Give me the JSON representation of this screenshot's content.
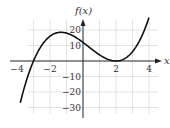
{
  "chart_data": {
    "type": "line",
    "title": "",
    "xlabel": "x",
    "ylabel": "f(x)",
    "xlim": [
      -4,
      4
    ],
    "ylim": [
      -35,
      28
    ],
    "grid": true,
    "x_ticks": [
      -4,
      -2,
      2,
      4
    ],
    "x_tick_labels": [
      "−4",
      "−2",
      "2",
      "4"
    ],
    "y_ticks": [
      20,
      10,
      -10,
      -20,
      -30
    ],
    "y_tick_labels": [
      "20",
      "10",
      "−10",
      "−20",
      "−30"
    ],
    "series": [
      {
        "name": "f(x)",
        "x": [
          -3.8,
          -3.5,
          -3,
          -2.5,
          -2,
          -1.5,
          -1.333,
          -1,
          -0.5,
          0,
          0.5,
          1,
          1.5,
          2,
          2.5,
          3,
          3.5,
          4
        ],
        "values": [
          -27,
          -15,
          0,
          9.1,
          16,
          18.4,
          18.5,
          18,
          15.6,
          12,
          7.9,
          4,
          1.1,
          0,
          1.4,
          6,
          14.6,
          28
        ]
      }
    ],
    "annotations": []
  }
}
